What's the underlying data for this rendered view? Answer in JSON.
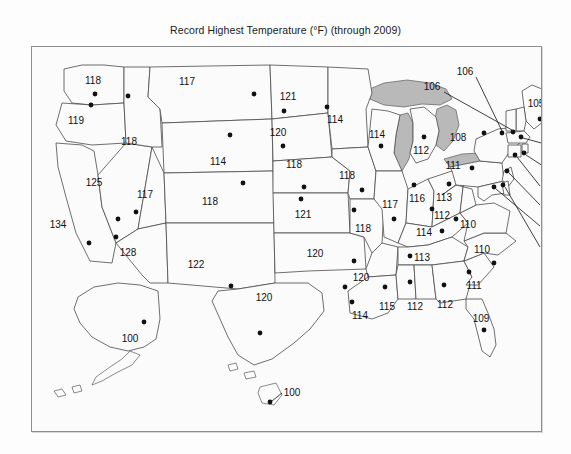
{
  "figure": {
    "title": "Record Highest Temperature (°F) (through 2009)",
    "panel_border_color": "#8e8e8e",
    "background_color": "#fdfdfd",
    "lake_fill_color": "#b9b9b9",
    "state_outline_color": "#4a4a4a",
    "label_color": "#111111"
  },
  "chart_data": {
    "type": "map",
    "title": "Record Highest Temperature (°F) (through 2009)",
    "unit": "°F",
    "value_label": "Record Highest Temperature",
    "through_year": 2009,
    "xlabel": "",
    "ylabel": "",
    "legend": "none",
    "grid": false,
    "regions": [
      {
        "code": "WA",
        "name": "Washington",
        "value": 118,
        "label_x": 61,
        "label_y": 34,
        "dot_x": 63,
        "dot_y": 47,
        "callout": false
      },
      {
        "code": "OR",
        "name": "Oregon",
        "value": 119,
        "label_x": 44,
        "label_y": 74,
        "dot_x": 59,
        "dot_y": 58,
        "callout": false
      },
      {
        "code": "ID",
        "name": "Idaho",
        "value": 118,
        "label_x": 97,
        "label_y": 95,
        "dot_x": 96,
        "dot_y": 49,
        "callout": false
      },
      {
        "code": "MT",
        "name": "Montana",
        "value": 117,
        "label_x": 155,
        "label_y": 35,
        "dot_x": 222,
        "dot_y": 47,
        "callout": false
      },
      {
        "code": "WY",
        "name": "Wyoming",
        "value": 114,
        "label_x": 186,
        "label_y": 115,
        "dot_x": 198,
        "dot_y": 88,
        "callout": false
      },
      {
        "code": "NV",
        "name": "Nevada",
        "value": 125,
        "label_x": 62,
        "label_y": 136,
        "dot_x": 86,
        "dot_y": 172,
        "callout": false
      },
      {
        "code": "CA",
        "name": "California",
        "value": 134,
        "label_x": 26,
        "label_y": 178,
        "dot_x": 57,
        "dot_y": 196,
        "callout": false
      },
      {
        "code": "UT",
        "name": "Utah",
        "value": 117,
        "label_x": 113,
        "label_y": 148,
        "dot_x": 104,
        "dot_y": 165,
        "callout": false
      },
      {
        "code": "CO",
        "name": "Colorado",
        "value": 118,
        "label_x": 178,
        "label_y": 155,
        "dot_x": 211,
        "dot_y": 136,
        "callout": false
      },
      {
        "code": "AZ",
        "name": "Arizona",
        "value": 128,
        "label_x": 96,
        "label_y": 206,
        "dot_x": 84,
        "dot_y": 190,
        "callout": false
      },
      {
        "code": "NM",
        "name": "New Mexico",
        "value": 122,
        "label_x": 164,
        "label_y": 218,
        "dot_x": 199,
        "dot_y": 239,
        "callout": false
      },
      {
        "code": "TX",
        "name": "Texas",
        "value": 120,
        "label_x": 232,
        "label_y": 251,
        "dot_x": 228,
        "dot_y": 286,
        "callout": false
      },
      {
        "code": "ND",
        "name": "North Dakota",
        "value": 121,
        "label_x": 256,
        "label_y": 50,
        "dot_x": 252,
        "dot_y": 64,
        "callout": false
      },
      {
        "code": "SD",
        "name": "South Dakota",
        "value": 120,
        "label_x": 246,
        "label_y": 86,
        "dot_x": 251,
        "dot_y": 99,
        "callout": false
      },
      {
        "code": "NE",
        "name": "Nebraska",
        "value": 118,
        "label_x": 262,
        "label_y": 118,
        "dot_x": 272,
        "dot_y": 140,
        "callout": false
      },
      {
        "code": "KS",
        "name": "Kansas",
        "value": 121,
        "label_x": 271,
        "label_y": 168,
        "dot_x": 269,
        "dot_y": 152,
        "callout": false
      },
      {
        "code": "OK",
        "name": "Oklahoma",
        "value": 120,
        "label_x": 283,
        "label_y": 207,
        "dot_x": 313,
        "dot_y": 240,
        "callout": false
      },
      {
        "code": "MN",
        "name": "Minnesota",
        "value": 114,
        "label_x": 303,
        "label_y": 73,
        "dot_x": 295,
        "dot_y": 60,
        "callout": false
      },
      {
        "code": "IA",
        "name": "Iowa",
        "value": 118,
        "label_x": 315,
        "label_y": 129,
        "dot_x": 330,
        "dot_y": 143,
        "callout": false
      },
      {
        "code": "MO",
        "name": "Missouri",
        "value": 118,
        "label_x": 331,
        "label_y": 182,
        "dot_x": 322,
        "dot_y": 163,
        "callout": false
      },
      {
        "code": "AR",
        "name": "Arkansas",
        "value": 120,
        "label_x": 329,
        "label_y": 231,
        "dot_x": 322,
        "dot_y": 214,
        "callout": false
      },
      {
        "code": "LA",
        "name": "Louisiana",
        "value": 114,
        "label_x": 328,
        "label_y": 269,
        "dot_x": 320,
        "dot_y": 255,
        "callout": false
      },
      {
        "code": "WI",
        "name": "Wisconsin",
        "value": 114,
        "label_x": 345,
        "label_y": 88,
        "dot_x": 349,
        "dot_y": 99,
        "callout": false
      },
      {
        "code": "MI",
        "name": "Michigan",
        "value": 112,
        "label_x": 389,
        "label_y": 104,
        "dot_x": 392,
        "dot_y": 90,
        "callout": false
      },
      {
        "code": "IL",
        "name": "Illinois",
        "value": 117,
        "label_x": 358,
        "label_y": 158,
        "dot_x": 362,
        "dot_y": 172,
        "callout": false
      },
      {
        "code": "IN",
        "name": "Indiana",
        "value": 116,
        "label_x": 385,
        "label_y": 152,
        "dot_x": 382,
        "dot_y": 138,
        "callout": false
      },
      {
        "code": "OH",
        "name": "Ohio",
        "value": 113,
        "label_x": 412,
        "label_y": 151,
        "dot_x": 417,
        "dot_y": 137,
        "callout": false
      },
      {
        "code": "KY",
        "name": "Kentucky",
        "value": 114,
        "label_x": 392,
        "label_y": 186,
        "dot_x": 410,
        "dot_y": 184,
        "callout": false
      },
      {
        "code": "TN",
        "name": "Tennessee",
        "value": 113,
        "label_x": 390,
        "label_y": 211,
        "dot_x": 378,
        "dot_y": 209,
        "callout": false
      },
      {
        "code": "MS",
        "name": "Mississippi",
        "value": 115,
        "label_x": 355,
        "label_y": 260,
        "dot_x": 353,
        "dot_y": 240,
        "callout": false
      },
      {
        "code": "AL",
        "name": "Alabama",
        "value": 112,
        "label_x": 383,
        "label_y": 260,
        "dot_x": 378,
        "dot_y": 235,
        "callout": false
      },
      {
        "code": "GA",
        "name": "Georgia",
        "value": 112,
        "label_x": 413,
        "label_y": 258,
        "dot_x": 412,
        "dot_y": 238,
        "callout": false
      },
      {
        "code": "SC",
        "name": "South Carolina",
        "value": 111,
        "label_x": 442,
        "label_y": 239,
        "dot_x": 437,
        "dot_y": 225,
        "callout": false
      },
      {
        "code": "NC",
        "name": "North Carolina",
        "value": 110,
        "label_x": 450,
        "label_y": 203,
        "dot_x": 462,
        "dot_y": 216,
        "callout": false
      },
      {
        "code": "VA",
        "name": "Virginia",
        "value": 110,
        "label_x": 436,
        "label_y": 178,
        "dot_x": 424,
        "dot_y": 172,
        "callout": false
      },
      {
        "code": "WV",
        "name": "West Virginia",
        "value": 112,
        "label_x": 410,
        "label_y": 169,
        "dot_x": 400,
        "dot_y": 162,
        "callout": false
      },
      {
        "code": "PA",
        "name": "Pennsylvania",
        "value": 111,
        "label_x": 421,
        "label_y": 119,
        "dot_x": 440,
        "dot_y": 121,
        "callout": false
      },
      {
        "code": "NY",
        "name": "New York",
        "value": 108,
        "label_x": 426,
        "label_y": 91,
        "dot_x": 452,
        "dot_y": 86,
        "callout": false
      },
      {
        "code": "FL",
        "name": "Florida",
        "value": 109,
        "label_x": 449,
        "label_y": 272,
        "dot_x": 452,
        "dot_y": 283,
        "callout": false
      },
      {
        "code": "AK",
        "name": "Alaska",
        "value": 100,
        "label_x": 98,
        "label_y": 292,
        "dot_x": 112,
        "dot_y": 275,
        "callout": false
      },
      {
        "code": "ME",
        "name": "Maine",
        "value": 105,
        "label_x": 504,
        "label_y": 57,
        "dot_x": 508,
        "dot_y": 72,
        "callout": false
      },
      {
        "code": "VT",
        "name": "Vermont",
        "value": 106,
        "label_x": 433,
        "label_y": 25,
        "dot_x": 470,
        "dot_y": 86,
        "callout": true,
        "leader": [
          [
            444,
            30
          ],
          [
            470,
            84
          ]
        ]
      },
      {
        "code": "NH",
        "name": "New Hampshire",
        "value": 106,
        "label_x": 400,
        "label_y": 40,
        "dot_x": 481,
        "dot_y": 85,
        "callout": true,
        "leader": [
          [
            412,
            45
          ],
          [
            480,
            83
          ]
        ]
      },
      {
        "code": "MA",
        "name": "Massachusetts",
        "value": 107,
        "label_x": 522,
        "label_y": 97,
        "dot_x": 489,
        "dot_y": 90,
        "callout": true,
        "leader": [
          [
            513,
            97
          ],
          [
            491,
            91
          ]
        ]
      },
      {
        "code": "RI",
        "name": "Rhode Island",
        "value": 104,
        "label_x": 522,
        "label_y": 119,
        "dot_x": 492,
        "dot_y": 106,
        "callout": true,
        "leader": [
          [
            511,
            119
          ],
          [
            494,
            108
          ]
        ]
      },
      {
        "code": "CT",
        "name": "Connecticut",
        "value": 106,
        "label_x": 519,
        "label_y": 140,
        "dot_x": 483,
        "dot_y": 108,
        "callout": true,
        "leader": [
          [
            508,
            139
          ],
          [
            485,
            110
          ]
        ]
      },
      {
        "code": "NJ",
        "name": "New Jersey",
        "value": 110,
        "label_x": 519,
        "label_y": 159,
        "dot_x": 475,
        "dot_y": 124,
        "callout": true,
        "leader": [
          [
            508,
            158
          ],
          [
            477,
            126
          ]
        ]
      },
      {
        "code": "MD",
        "name": "Maryland",
        "value": 110,
        "label_x": 519,
        "label_y": 180,
        "dot_x": 462,
        "dot_y": 140,
        "callout": true,
        "leader": [
          [
            508,
            179
          ],
          [
            464,
            142
          ]
        ]
      },
      {
        "code": "DE",
        "name": "Delaware",
        "value": 109,
        "label_x": 519,
        "label_y": 201,
        "dot_x": 471,
        "dot_y": 138,
        "callout": true,
        "leader": [
          [
            508,
            200
          ],
          [
            473,
            140
          ]
        ]
      },
      {
        "code": "HI",
        "name": "Hawaii",
        "value": 100,
        "label_x": 260,
        "label_y": 346,
        "dot_x": 238,
        "dot_y": 355,
        "callout": true,
        "leader": [
          [
            250,
            346
          ],
          [
            240,
            354
          ]
        ]
      }
    ]
  }
}
